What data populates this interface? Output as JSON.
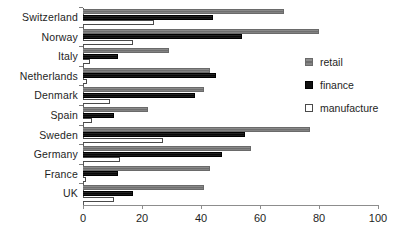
{
  "chart_data": {
    "type": "bar",
    "orientation": "horizontal",
    "title": "",
    "subtitle": "",
    "xlabel": "",
    "ylabel": "",
    "xlim": [
      0,
      100
    ],
    "xticks": [
      0,
      20,
      40,
      60,
      80,
      100
    ],
    "xtick_labels": [
      "0",
      "20",
      "40",
      "60",
      "80",
      "100"
    ],
    "grid": false,
    "legend_position": "right",
    "categories": [
      "Switzerland",
      "Norway",
      "Italy",
      "Netherlands",
      "Denmark",
      "Spain",
      "Sweden",
      "Germany",
      "France",
      "UK"
    ],
    "series": [
      {
        "name": "retail",
        "color": "#7b7b7b",
        "values": [
          68,
          80,
          29,
          43,
          41,
          22,
          77,
          57,
          43,
          41
        ]
      },
      {
        "name": "finance",
        "color": "#101010",
        "values": [
          44,
          54,
          12,
          45,
          38,
          10.5,
          55,
          47,
          12,
          17
        ]
      },
      {
        "name": "manufacture",
        "color": "#ffffff",
        "values": [
          24,
          17,
          2.5,
          1.5,
          9,
          3,
          27,
          12.5,
          1,
          10.5
        ]
      }
    ]
  },
  "legend": {
    "items": [
      {
        "label": "retail",
        "key": "retail"
      },
      {
        "label": "finance",
        "key": "finance"
      },
      {
        "label": "manufacture",
        "key": "manufacture"
      }
    ]
  }
}
